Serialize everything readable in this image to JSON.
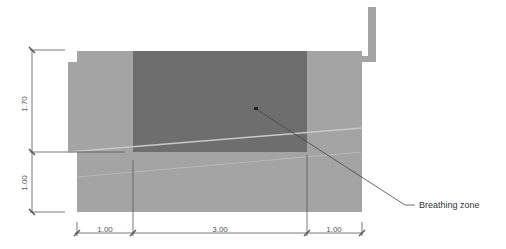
{
  "diagram": {
    "annotation": "Breathing zone",
    "dimensions": {
      "vertical": [
        "1.70",
        "1.00"
      ],
      "horizontal": [
        "1.00",
        "3.00",
        "1.00"
      ]
    },
    "colors": {
      "room": "#a4a4a4",
      "breathing_zone": "#6e6e6e",
      "dimension_line": "#555555",
      "sight_line": "#c4c4c4"
    }
  }
}
